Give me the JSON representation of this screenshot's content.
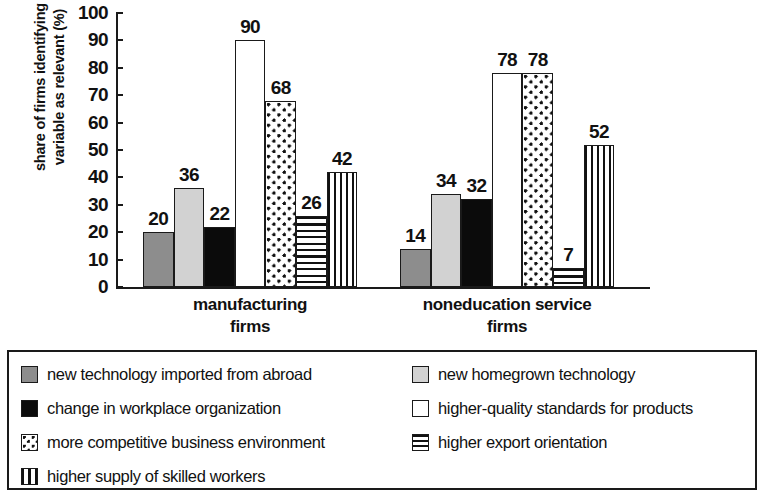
{
  "chart_data": {
    "type": "bar",
    "title": "",
    "xlabel": "",
    "ylabel": "share of firms identifying variable as relevant (%)",
    "ylabel_lines": [
      "share of firms identifying",
      "variable as relevant (%)"
    ],
    "ylim": [
      0,
      100
    ],
    "yticks": [
      100,
      90,
      80,
      70,
      60,
      50,
      40,
      30,
      20,
      10,
      0
    ],
    "grid": false,
    "legend_position": "below",
    "categories": [
      "manufacturing firms",
      "noneducation service firms"
    ],
    "category_lines": [
      [
        "manufacturing",
        "firms"
      ],
      [
        "noneducation service",
        "firms"
      ]
    ],
    "series": [
      {
        "name": "new technology imported from abroad",
        "pattern": "solid-gray",
        "color": "#8d8d8d",
        "values": [
          20,
          14
        ]
      },
      {
        "name": "new homegrown technology",
        "pattern": "solid-light-gray",
        "color": "#d2d2d2",
        "values": [
          36,
          34
        ]
      },
      {
        "name": "change in workplace organization",
        "pattern": "solid-black",
        "color": "#0b0b0b",
        "values": [
          22,
          32
        ]
      },
      {
        "name": "higher-quality standards for products",
        "pattern": "empty-white",
        "color": "#ffffff",
        "values": [
          90,
          78
        ]
      },
      {
        "name": "more competitive business environment",
        "pattern": "dots",
        "color": "#ffffff",
        "values": [
          68,
          78
        ]
      },
      {
        "name": "higher export orientation",
        "pattern": "horizontal-lines",
        "color": "#ffffff",
        "values": [
          26,
          7
        ]
      },
      {
        "name": "higher supply of skilled workers",
        "pattern": "vertical-lines",
        "color": "#ffffff",
        "values": [
          42,
          52
        ]
      }
    ]
  },
  "legend": {
    "column_left": [
      {
        "label": "new technology imported from abroad",
        "pattern": "solid-gray"
      },
      {
        "label": "change in workplace organization",
        "pattern": "solid-black"
      },
      {
        "label": "more competitive business environment",
        "pattern": "dots"
      },
      {
        "label": "higher supply of skilled workers",
        "pattern": "vertical-lines"
      }
    ],
    "column_right": [
      {
        "label": "new homegrown technology",
        "pattern": "solid-light-gray"
      },
      {
        "label": "higher-quality standards for products",
        "pattern": "empty-white"
      },
      {
        "label": "higher export orientation",
        "pattern": "horizontal-lines"
      }
    ]
  }
}
